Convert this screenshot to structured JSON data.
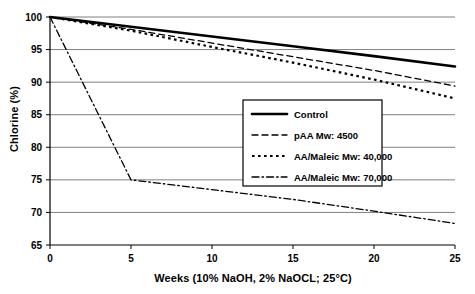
{
  "chart_data": {
    "type": "line",
    "title": "",
    "xlabel": "Weeks (10% NaOH, 2% NaOCL; 25°C)",
    "ylabel": "Chlorine (%)",
    "xlim": [
      0,
      25
    ],
    "ylim": [
      65,
      100
    ],
    "xticks": [
      0,
      5,
      10,
      15,
      20,
      25
    ],
    "yticks": [
      65,
      70,
      75,
      80,
      85,
      90,
      95,
      100
    ],
    "xtick_labels": [
      "0",
      "5",
      "10",
      "15",
      "20",
      "25"
    ],
    "ytick_labels": [
      "65",
      "70",
      "75",
      "80",
      "85",
      "90",
      "95",
      "100"
    ],
    "grid": "horizontal",
    "legend_position": "center-right",
    "series": [
      {
        "name": "Control",
        "style": "solid",
        "color": "#000000",
        "width": 2.6,
        "x": [
          0,
          5,
          10,
          15,
          20,
          25
        ],
        "values": [
          100.0,
          98.5,
          97.0,
          95.5,
          94.0,
          92.4
        ]
      },
      {
        "name": "pAA Mw: 4500",
        "style": "dashed",
        "color": "#000000",
        "width": 1.3,
        "x": [
          0,
          5,
          10,
          15,
          20,
          25
        ],
        "values": [
          100.0,
          98.1,
          96.0,
          93.9,
          91.8,
          89.4
        ]
      },
      {
        "name": "AA/Maleic Mw: 40,000",
        "style": "dotted",
        "color": "#000000",
        "width": 2.2,
        "x": [
          0,
          5,
          10,
          15,
          20,
          25
        ],
        "values": [
          100.0,
          97.9,
          95.4,
          93.0,
          90.4,
          87.5
        ]
      },
      {
        "name": "AA/Maleic Mw: 70,000",
        "style": "dash-dot",
        "color": "#000000",
        "width": 1.3,
        "x": [
          0,
          5,
          10,
          15,
          20,
          25
        ],
        "values": [
          100.0,
          75.0,
          73.5,
          72.0,
          70.2,
          68.3
        ]
      }
    ]
  },
  "axes": {
    "ylabel": "Chlorine (%)",
    "xlabel": "Weeks (10% NaOH, 2% NaOCL; 25°C)"
  },
  "legend": {
    "items": [
      {
        "label": "Control",
        "style": "solid"
      },
      {
        "label": "pAA Mw: 4500",
        "style": "dashed"
      },
      {
        "label": "AA/Maleic Mw: 40,000",
        "style": "dotted"
      },
      {
        "label": "AA/Maleic Mw: 70,000",
        "style": "dash-dot"
      }
    ]
  },
  "colors": {
    "line": "#000000",
    "grid": "#808080",
    "axis": "#000000",
    "background": "#ffffff"
  }
}
